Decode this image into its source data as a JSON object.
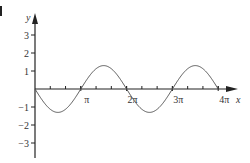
{
  "chart_data": {
    "type": "line",
    "title": "",
    "xlabel": "x",
    "ylabel": "y",
    "function": "y = -1.3 sin(x)",
    "x_range": [
      0,
      12.566
    ],
    "ylim": [
      -3,
      3
    ],
    "x_ticks": [
      {
        "value": 3.14159,
        "label": "π"
      },
      {
        "value": 6.28318,
        "label": "2π"
      },
      {
        "value": 9.42478,
        "label": "3π"
      },
      {
        "value": 12.56637,
        "label": "4π"
      }
    ],
    "x_minor_tick_step": 1.0472,
    "y_ticks": [
      {
        "value": 3,
        "label": "3"
      },
      {
        "value": 2,
        "label": "2"
      },
      {
        "value": 1,
        "label": "1"
      },
      {
        "value": -1,
        "label": "−1"
      },
      {
        "value": -2,
        "label": "−2"
      },
      {
        "value": -3,
        "label": "−3"
      }
    ],
    "series": [
      {
        "name": "curve",
        "x": [
          0,
          1.5708,
          3.14159,
          4.71239,
          6.28318,
          7.85398,
          9.42478,
          10.99557,
          12.56637
        ],
        "values": [
          0,
          -1.3,
          0,
          1.3,
          0,
          -1.3,
          0,
          1.3,
          0
        ]
      }
    ],
    "grid": false,
    "legend": null,
    "colors": {
      "axis": "#222222",
      "curve": "#555555",
      "text": "#333333"
    }
  }
}
